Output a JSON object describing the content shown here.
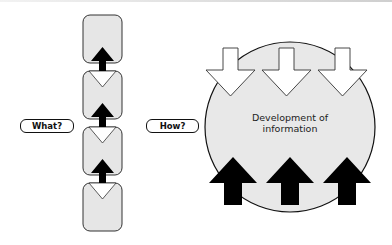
{
  "labels": {
    "what": "What?",
    "how": "How?",
    "center_line1": "Development of",
    "center_line2": "information"
  },
  "colors": {
    "box_fill": "#e6e6e6",
    "stroke": "#111111",
    "circle_fill": "#e8e8e8",
    "arrow_up_fill": "#000000",
    "arrow_down_fill": "#ffffff"
  },
  "left_stack": {
    "box_count": 4,
    "up_arrows_between_boxes": 3
  },
  "right_circle": {
    "down_arrows": 3,
    "up_arrows": 3
  }
}
